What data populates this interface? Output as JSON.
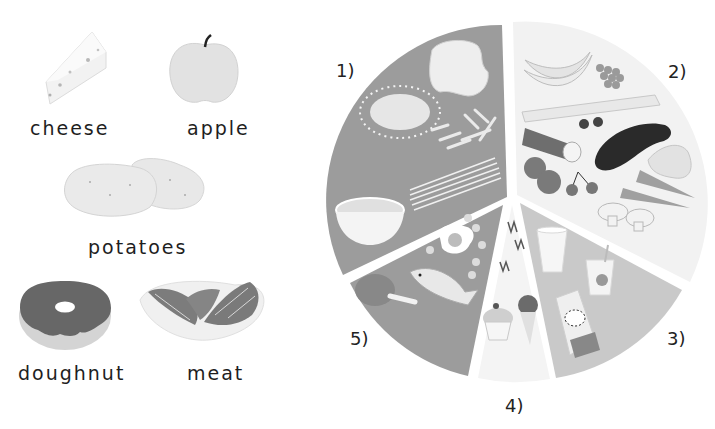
{
  "left_panel": {
    "items": [
      {
        "label": "cheese",
        "icon": "cheese-icon"
      },
      {
        "label": "apple",
        "icon": "apple-icon"
      },
      {
        "label": "potatoes",
        "icon": "potatoes-icon"
      },
      {
        "label": "doughnut",
        "icon": "doughnut-icon"
      },
      {
        "label": "meat",
        "icon": "meat-icon"
      }
    ]
  },
  "food_wheel": {
    "segments": [
      {
        "label": "1)",
        "group": "grains",
        "color": "#9c9c9c",
        "icons": [
          "bread-icon",
          "rice-icon",
          "pasta-icon",
          "spaghetti-icon",
          "cereal-bowl-icon"
        ]
      },
      {
        "label": "2)",
        "group": "fruit-and-vegetables",
        "color": "#f2f2f2",
        "icons": [
          "banana-icon",
          "grapes-icon",
          "leek-icon",
          "cucumber-icon",
          "blackberry-icon",
          "eggplant-icon",
          "pear-icon",
          "tomato-icon",
          "cherry-icon",
          "carrot-icon",
          "mushroom-icon"
        ]
      },
      {
        "label": "3)",
        "group": "dairy",
        "color": "#c9c9c9",
        "icons": [
          "milk-glass-icon",
          "yogurt-icon",
          "milk-carton-icon"
        ]
      },
      {
        "label": "4)",
        "group": "sweets",
        "color": "#f4f4f4",
        "icons": [
          "candy-icon",
          "cupcake-icon",
          "ice-cream-icon"
        ]
      },
      {
        "label": "5)",
        "group": "protein",
        "color": "#9c9c9c",
        "icons": [
          "chicken-leg-icon",
          "fish-icon",
          "egg-icon",
          "beans-icon"
        ]
      }
    ]
  }
}
